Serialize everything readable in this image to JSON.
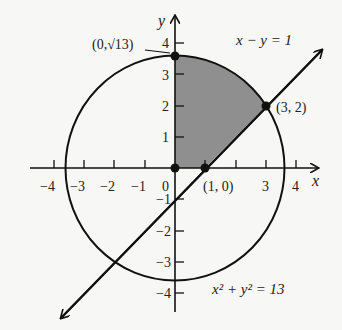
{
  "diagram": {
    "type": "coordinate-plane",
    "axes": {
      "x_label": "x",
      "y_label": "y",
      "x_ticks": [
        "−4",
        "−3",
        "−2",
        "−1",
        "0",
        "3",
        "4"
      ],
      "x_tick_values": [
        -4,
        -3,
        -2,
        -1,
        0,
        1,
        2,
        3,
        4
      ],
      "y_ticks_positive": [
        "1",
        "2",
        "3",
        "4"
      ],
      "y_ticks_negative": [
        "−1",
        "−2",
        "−3",
        "−4"
      ],
      "origin_label": "0"
    },
    "curves": {
      "circle_equation_lhs": "x² + y² = 13",
      "line_equation": "x − y = 1"
    },
    "points": {
      "top": "(0,√13)",
      "intersection": "(3, 2)",
      "x_intercept": "(1, 0)"
    },
    "shaded_region": "region bounded by y-axis, circle, and line x − y = 1 in first quadrant",
    "colors": {
      "stroke": "#111111",
      "shade": "#8f8f8f",
      "background": "#f7f7f5"
    }
  }
}
